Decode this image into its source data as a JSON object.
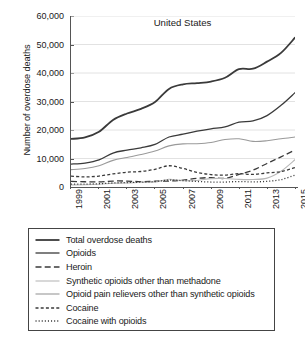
{
  "chart_data": {
    "type": "line",
    "title": "United States",
    "xlabel": "",
    "ylabel": "Number of overdose deaths",
    "xlim": [
      1999,
      2015
    ],
    "ylim": [
      0,
      60000
    ],
    "grid": true,
    "legend_position": "below-plot",
    "x": [
      1999,
      2000,
      2001,
      2002,
      2003,
      2004,
      2005,
      2006,
      2007,
      2008,
      2009,
      2010,
      2011,
      2012,
      2013,
      2014,
      2015
    ],
    "xticks": [
      "1999",
      "2001",
      "2003",
      "2005",
      "2007",
      "2009",
      "2011",
      "2013",
      "2015"
    ],
    "yticks": [
      "0",
      "10,000",
      "20,000",
      "30,000",
      "40,000",
      "50,000",
      "60,000"
    ],
    "ytick_values": [
      0,
      10000,
      20000,
      30000,
      40000,
      50000,
      60000
    ],
    "series": [
      {
        "name": "Total overdose deaths",
        "style": "solid",
        "width": 1.8,
        "color": "#3a3a3a",
        "values": [
          16849,
          17415,
          19394,
          23518,
          25785,
          27424,
          29813,
          34425,
          36010,
          36450,
          37004,
          38329,
          41340,
          41502,
          43982,
          47055,
          52404
        ]
      },
      {
        "name": "Opioids",
        "style": "solid",
        "width": 1.3,
        "color": "#3a3a3a",
        "values": [
          8048,
          8407,
          9496,
          11920,
          12940,
          13756,
          14918,
          17545,
          18516,
          19582,
          20422,
          21089,
          22784,
          23166,
          25052,
          28647,
          33091
        ]
      },
      {
        "name": "Heroin",
        "style": "dashed-long",
        "width": 1.3,
        "color": "#3a3a3a",
        "values": [
          1960,
          1842,
          1779,
          2089,
          2080,
          1878,
          2009,
          2088,
          2399,
          3041,
          3278,
          3036,
          4397,
          5925,
          8257,
          10574,
          12989
        ]
      },
      {
        "name": "Synthetic opioids other than methadone",
        "style": "solid",
        "width": 1.1,
        "color": "#b8b8b8",
        "values": [
          730,
          782,
          957,
          1295,
          1400,
          1664,
          1742,
          2707,
          2213,
          2306,
          2946,
          3007,
          2666,
          2628,
          3105,
          5544,
          9580
        ]
      },
      {
        "name": "Opioid pain relievers other than synthetic opioids",
        "style": "solid",
        "width": 1.1,
        "color": "#9a9a9a",
        "values": [
          6093,
          6478,
          7456,
          9342,
          10372,
          11383,
          12644,
          14432,
          15148,
          15184,
          15597,
          16651,
          16917,
          16007,
          16235,
          16941,
          17536
        ]
      },
      {
        "name": "Cocaine",
        "style": "dashed-short",
        "width": 1.3,
        "color": "#3a3a3a",
        "values": [
          3822,
          3544,
          3833,
          4599,
          5196,
          5443,
          6208,
          7448,
          6512,
          5129,
          4350,
          4183,
          4681,
          4404,
          4944,
          5415,
          6784
        ]
      },
      {
        "name": "Cocaine with opioids",
        "style": "dotted",
        "width": 1.3,
        "color": "#3a3a3a",
        "values": [
          1024,
          1029,
          1149,
          1415,
          1566,
          1706,
          1912,
          2437,
          2235,
          1941,
          1740,
          1729,
          1919,
          1784,
          2002,
          2588,
          4172
        ]
      }
    ]
  },
  "legend": {
    "items": [
      {
        "label": "Total overdose deaths"
      },
      {
        "label": "Opioids"
      },
      {
        "label": "Heroin"
      },
      {
        "label": "Synthetic opioids other than methadone"
      },
      {
        "label": "Opioid pain relievers other than synthetic opioids"
      },
      {
        "label": "Cocaine"
      },
      {
        "label": "Cocaine with opioids"
      }
    ]
  }
}
